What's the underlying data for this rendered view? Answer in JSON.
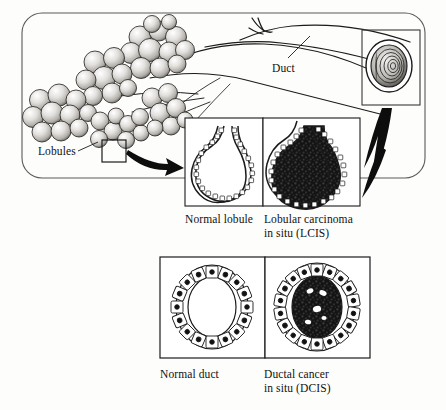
{
  "figure": {
    "type": "medical-illustration",
    "background_color": "#fdfdfc",
    "ink_color": "#111111"
  },
  "labels": {
    "duct": "Duct",
    "lobules": "Lobules"
  },
  "panels": {
    "overview": {
      "name": "breast-anatomy-overview",
      "shape": "rounded-rectangle",
      "contents": [
        "lobule clusters",
        "branching ducts",
        "duct cross-section inset"
      ]
    },
    "lobule_row": [
      {
        "id": "normal-lobule",
        "caption": "Normal lobule",
        "fill": "open lumen",
        "cell_count": 34
      },
      {
        "id": "lcis",
        "caption": "Lobular carcinoma\nin situ (LCIS)",
        "fill": "solid dark tumor cells",
        "cell_count": 34
      }
    ],
    "duct_row": [
      {
        "id": "normal-duct",
        "caption": "Normal duct",
        "fill": "open lumen",
        "cell_count": 16
      },
      {
        "id": "dcis",
        "caption": "Ductal cancer\nin situ (DCIS)",
        "fill": "dark tumor cells with clear spaces",
        "cell_count": 18
      }
    ]
  },
  "arrows": [
    {
      "id": "lobule-zoom-arrow",
      "from": "lobule detail box",
      "to": "normal lobule panel",
      "style": "curved solid"
    },
    {
      "id": "duct-zoom-arrow",
      "from": "duct cross-section box",
      "to": "duct panels",
      "style": "tapered solid"
    }
  ]
}
